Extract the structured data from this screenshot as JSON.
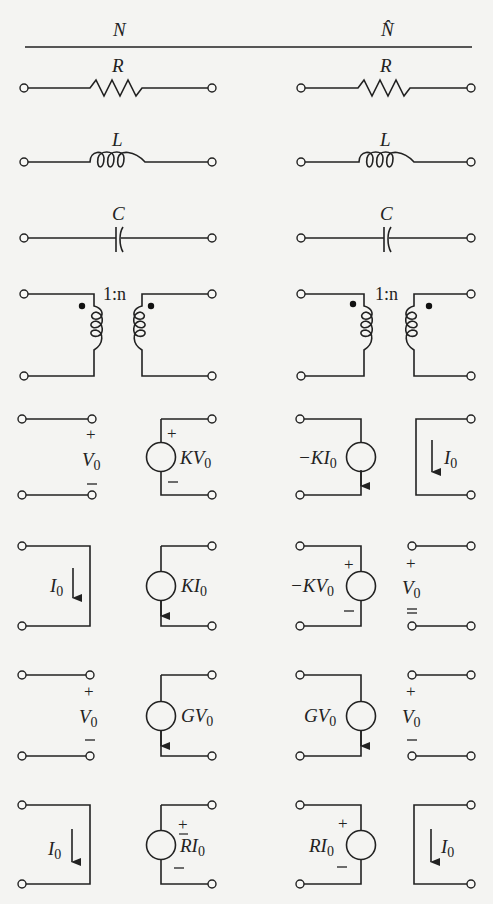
{
  "header": {
    "left_title": "N",
    "right_title": "N̂"
  },
  "rows": [
    {
      "element": "resistor",
      "left": {
        "label": "R"
      },
      "right": {
        "label": "R"
      }
    },
    {
      "element": "inductor",
      "left": {
        "label": "L"
      },
      "right": {
        "label": "L"
      }
    },
    {
      "element": "capacitor",
      "left": {
        "label": "C"
      },
      "right": {
        "label": "C"
      }
    },
    {
      "element": "ideal-transformer",
      "left": {
        "ratio": "1:n"
      },
      "right": {
        "ratio": "1:n"
      }
    },
    {
      "element": "VCVS",
      "left": {
        "port1": {
          "label": "V",
          "sub": "0",
          "plus": "+",
          "minus": "—"
        },
        "port2": {
          "label": "KV",
          "sub": "0",
          "plus": "+",
          "minus": "—"
        }
      },
      "right": {
        "port1": {
          "label": "−KI",
          "sub": "0"
        },
        "port2": {
          "label": "I",
          "sub": "0"
        }
      }
    },
    {
      "element": "CCCS",
      "left": {
        "port1": {
          "label": "I",
          "sub": "0"
        },
        "port2": {
          "label": "KI",
          "sub": "0"
        }
      },
      "right": {
        "port1": {
          "label": "−KV",
          "sub": "0",
          "plus": "+",
          "minus": "—"
        },
        "port2": {
          "label": "V",
          "sub": "0",
          "plus": "+",
          "minus": "—"
        }
      }
    },
    {
      "element": "VCCS",
      "left": {
        "port1": {
          "label": "V",
          "sub": "0",
          "plus": "+",
          "minus": "—"
        },
        "port2": {
          "label": "GV",
          "sub": "0"
        }
      },
      "right": {
        "port1": {
          "label": "GV",
          "sub": "0"
        },
        "port2": {
          "label": "V",
          "sub": "0",
          "plus": "+",
          "minus": "—"
        }
      }
    },
    {
      "element": "CCVS",
      "left": {
        "port1": {
          "label": "I",
          "sub": "0"
        },
        "port2": {
          "label": "RI",
          "sub": "0",
          "plus": "+",
          "minus": "—"
        }
      },
      "right": {
        "port1": {
          "label": "RI",
          "sub": "0",
          "plus": "+",
          "minus": "—"
        },
        "port2": {
          "label": "I",
          "sub": "0"
        }
      }
    }
  ]
}
